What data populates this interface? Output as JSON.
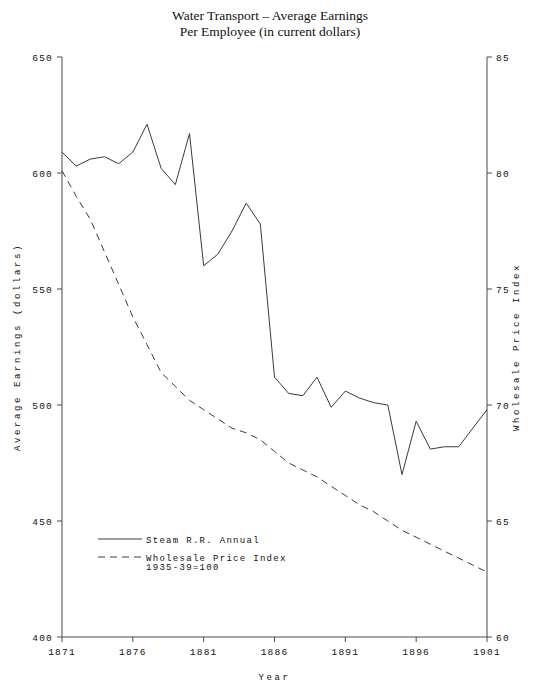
{
  "chart_data": {
    "type": "line",
    "title": "Water Transport – Average Earnings\nPer Employee (in current dollars)",
    "title_line1": "Water Transport – Average Earnings",
    "title_line2": "Per Employee (in current dollars)",
    "xlabel": "Year",
    "ylabel": "Average Earnings (dollars)",
    "y2label": "Wholesale Price Index",
    "xlim": [
      1871,
      1901
    ],
    "ylim": [
      400,
      650
    ],
    "y2lim": [
      60,
      85
    ],
    "xticks": [
      1871,
      1876,
      1881,
      1886,
      1891,
      1896,
      1901
    ],
    "yticks": [
      400,
      450,
      500,
      550,
      600,
      650
    ],
    "y2ticks": [
      60,
      65,
      70,
      75,
      80,
      85
    ],
    "grid": false,
    "legend_position": "lower-left-inside",
    "x": [
      1871,
      1872,
      1873,
      1874,
      1875,
      1876,
      1877,
      1878,
      1879,
      1880,
      1881,
      1882,
      1883,
      1884,
      1885,
      1886,
      1887,
      1888,
      1889,
      1890,
      1891,
      1892,
      1893,
      1894,
      1895,
      1896,
      1897,
      1898,
      1899,
      1900,
      1901
    ],
    "series": [
      {
        "name": "Steam R.R. Annual",
        "axis": "left",
        "style": "solid",
        "color": "#3a3a3a",
        "values": [
          609,
          603,
          606,
          607,
          604,
          609,
          621,
          602,
          595,
          617,
          560,
          565,
          575,
          587,
          578,
          512,
          505,
          504,
          512,
          499,
          506,
          503,
          501,
          500,
          470,
          493,
          481,
          482,
          482,
          490,
          498
        ]
      },
      {
        "name": "Wholesale Price Index",
        "name_line2": "1935-39=100",
        "axis": "right",
        "style": "dashed",
        "color": "#3a3a3a",
        "values": [
          80.1,
          79.0,
          78.0,
          76.6,
          75.2,
          73.8,
          72.6,
          71.4,
          70.8,
          70.2,
          69.8,
          69.4,
          69.0,
          68.8,
          68.5,
          68.0,
          67.5,
          67.2,
          66.9,
          66.5,
          66.1,
          65.7,
          65.4,
          65.0,
          64.6,
          64.3,
          64.0,
          63.7,
          63.4,
          63.1,
          62.8
        ]
      }
    ],
    "legend": [
      {
        "label": "Steam R.R. Annual",
        "style": "solid"
      },
      {
        "label": "Wholesale Price Index",
        "sublabel": "1935-39=100",
        "style": "dashed"
      }
    ]
  }
}
